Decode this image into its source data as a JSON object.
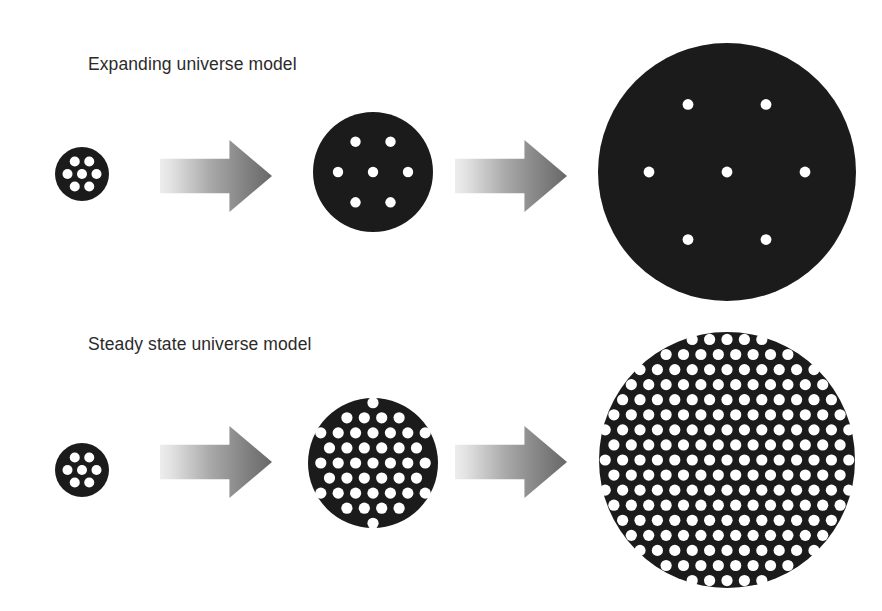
{
  "figure": {
    "title": "",
    "background_color": "#ffffff",
    "width": 882,
    "height": 611
  },
  "colors": {
    "universe_fill": "#1b1b1b",
    "galaxy_dot": "#ffffff",
    "arrow_light": "#e4e4e4",
    "arrow_dark": "#6e6e6e",
    "label_text": "#2b2b2b"
  },
  "rows": [
    {
      "id": "expanding",
      "label": "Expanding universe model",
      "label_position": {
        "x": 88,
        "y": 54
      },
      "dot_mode": "fixed-count",
      "dot_count_per_stage": [
        7,
        7,
        7
      ],
      "stages": [
        {
          "name": "stage-1",
          "center": {
            "x": 82,
            "y": 174
          },
          "radius": 27,
          "dot_radius": 5.0,
          "ring_radius": 14.5,
          "dots": [
            {
              "x": 0,
              "y": 0
            },
            {
              "x": 14.5,
              "y": 0
            },
            {
              "x": 7.25,
              "y": -12.56
            },
            {
              "x": -7.25,
              "y": -12.56
            },
            {
              "x": -14.5,
              "y": 0
            },
            {
              "x": -7.25,
              "y": 12.56
            },
            {
              "x": 7.25,
              "y": 12.56
            }
          ]
        },
        {
          "name": "stage-2",
          "center": {
            "x": 373,
            "y": 172
          },
          "radius": 60,
          "dot_radius": 5.2,
          "ring_radius": 35,
          "dots": [
            {
              "x": 0,
              "y": 0
            },
            {
              "x": 35,
              "y": 0
            },
            {
              "x": 17.5,
              "y": -30.31
            },
            {
              "x": -17.5,
              "y": -30.31
            },
            {
              "x": -35,
              "y": 0
            },
            {
              "x": -17.5,
              "y": 30.31
            },
            {
              "x": 17.5,
              "y": 30.31
            }
          ]
        },
        {
          "name": "stage-3",
          "center": {
            "x": 727,
            "y": 172
          },
          "radius": 129,
          "dot_radius": 5.4,
          "ring_radius": 78,
          "dots": [
            {
              "x": 0,
              "y": 0
            },
            {
              "x": 78,
              "y": 0
            },
            {
              "x": 39,
              "y": -67.55
            },
            {
              "x": -39,
              "y": -67.55
            },
            {
              "x": -78,
              "y": 0
            },
            {
              "x": -39,
              "y": 67.55
            },
            {
              "x": 39,
              "y": 67.55
            }
          ]
        }
      ],
      "arrows": [
        {
          "name": "arrow-1",
          "x": 160,
          "y": 140,
          "width": 112,
          "height": 72
        },
        {
          "name": "arrow-2",
          "x": 455,
          "y": 140,
          "width": 112,
          "height": 72
        }
      ]
    },
    {
      "id": "steady-state",
      "label": "Steady state universe model",
      "label_position": {
        "x": 88,
        "y": 334
      },
      "dot_mode": "constant-density",
      "lattice_pitch": 17.2,
      "dot_count_per_stage": [
        7,
        44,
        190
      ],
      "stages": [
        {
          "name": "stage-1",
          "center": {
            "x": 82,
            "y": 470
          },
          "radius": 27,
          "dot_radius": 5.0,
          "lattice": false,
          "ring_radius": 14.5,
          "dots": [
            {
              "x": 0,
              "y": 0
            },
            {
              "x": 14.5,
              "y": 0
            },
            {
              "x": 7.25,
              "y": -12.56
            },
            {
              "x": -7.25,
              "y": -12.56
            },
            {
              "x": -14.5,
              "y": 0
            },
            {
              "x": -7.25,
              "y": 12.56
            },
            {
              "x": 7.25,
              "y": 12.56
            }
          ]
        },
        {
          "name": "stage-2",
          "center": {
            "x": 373,
            "y": 463
          },
          "radius": 65,
          "dot_radius": 5.6,
          "lattice": true,
          "pitch": 17.4
        },
        {
          "name": "stage-3",
          "center": {
            "x": 727,
            "y": 460
          },
          "radius": 128,
          "dot_radius": 5.6,
          "lattice": true,
          "pitch": 17.4
        }
      ],
      "arrows": [
        {
          "name": "arrow-1",
          "x": 160,
          "y": 426,
          "width": 112,
          "height": 72
        },
        {
          "name": "arrow-2",
          "x": 455,
          "y": 426,
          "width": 112,
          "height": 72
        }
      ]
    }
  ],
  "arrow_shape": {
    "shaft_top_fraction": 0.26,
    "shaft_bottom_fraction": 0.74,
    "head_start_fraction": 0.62
  }
}
